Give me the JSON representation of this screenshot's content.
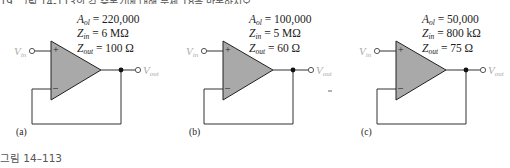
{
  "header": {
    "text": "19. 그림 14-113의 각 증폭기에 대해 문제 18을 반복하시오."
  },
  "circuits": [
    {
      "label": "(a)",
      "params": {
        "aol_label": "A",
        "aol_sub": "ol",
        "aol_value": "= 220,000",
        "zin_label": "Z",
        "zin_sub": "in",
        "zin_value": "= 6 MΩ",
        "zout_label": "Z",
        "zout_sub": "out",
        "zout_value": "= 100 Ω"
      },
      "vin": {
        "main": "V",
        "sub": "in"
      },
      "vout": {
        "main": "V",
        "sub": "out"
      },
      "plus": "+",
      "minus": "–"
    },
    {
      "label": "(b)",
      "params": {
        "aol_label": "A",
        "aol_sub": "ol",
        "aol_value": "= 100,000",
        "zin_label": "Z",
        "zin_sub": "in",
        "zin_value": "= 5 MΩ",
        "zout_label": "Z",
        "zout_sub": "out",
        "zout_value": "= 60 Ω"
      },
      "vin": {
        "main": "V",
        "sub": "in"
      },
      "vout": {
        "main": "V",
        "sub": "out"
      },
      "plus": "+",
      "minus": "–"
    },
    {
      "label": "(c)",
      "params": {
        "aol_label": "A",
        "aol_sub": "ol",
        "aol_value": "= 50,000",
        "zin_label": "Z",
        "zin_sub": "in",
        "zin_value": "= 800 kΩ",
        "zout_label": "Z",
        "zout_sub": "out",
        "zout_value": "= 75 Ω"
      },
      "vin": {
        "main": "V",
        "sub": "in"
      },
      "vout": {
        "main": "V",
        "sub": "out"
      },
      "plus": "+",
      "minus": "–"
    }
  ],
  "caption": "그림 14–113",
  "colors": {
    "opamp_fill": "#a9a9a9",
    "wire": "#222222",
    "label_gray": "#aaaaaa"
  }
}
